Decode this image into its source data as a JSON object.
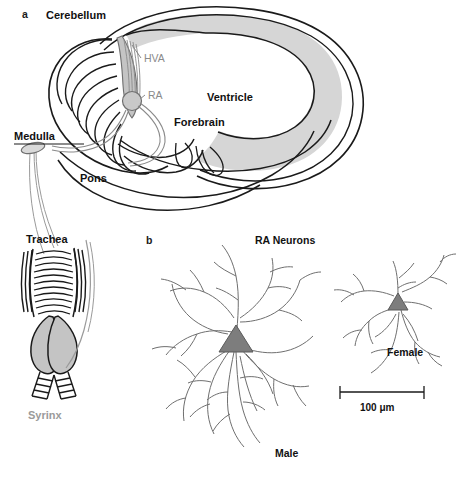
{
  "figure": {
    "panels": [
      {
        "letter": "a",
        "name": "songbird-brain-and-vocal-organ-schematic",
        "labels": {
          "cerebellum": "Cerebellum",
          "hva": "HVA",
          "ra": "RA",
          "ventricle": "Ventricle",
          "forebrain": "Forebrain",
          "medulla": "Medulla",
          "pons": "Pons",
          "trachea": "Trachea",
          "syrinx": "Syrinx"
        }
      },
      {
        "letter": "b",
        "name": "ra-neuron-camera-lucida-drawings",
        "title": "RA Neurons",
        "labels": {
          "male": "Male",
          "female": "Female"
        },
        "scale_bar": {
          "label": "100 μm",
          "value": 100,
          "unit": "μm"
        }
      }
    ]
  },
  "colors": {
    "outline": "#1a1a1a",
    "ventricle_fill": "#d6d6d6",
    "hva_fill": "#cccccc",
    "ra_fill": "#c9c9c9",
    "syrinx_fill": "#c4c4c4",
    "soma_fill": "#7d7d7d",
    "dendrite_stroke": "#6f6f6f",
    "gray_text": "#9a9a9a",
    "nucleus_text": "#8a8a8a",
    "black_text": "#111111",
    "background": "#ffffff"
  }
}
